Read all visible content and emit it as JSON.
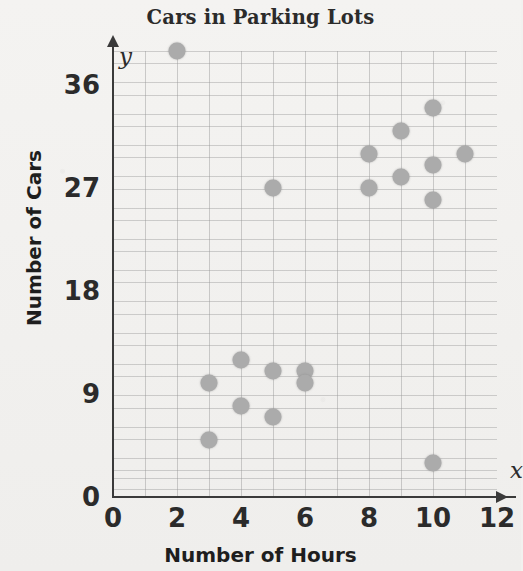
{
  "chart_data": {
    "type": "scatter",
    "title": "Cars in Parking Lots",
    "xlabel": "Number of Hours",
    "ylabel": "Number of Cars",
    "x_axis_symbol": "x",
    "y_axis_symbol": "y",
    "xlim": [
      0,
      12
    ],
    "ylim": [
      0,
      39
    ],
    "xticks": [
      "0",
      "2",
      "4",
      "6",
      "8",
      "10",
      "12"
    ],
    "xtick_values": [
      0,
      2,
      4,
      6,
      8,
      10,
      12
    ],
    "yticks": [
      "0",
      "9",
      "18",
      "27",
      "36"
    ],
    "ytick_values": [
      0,
      9,
      18,
      27,
      36
    ],
    "grid": true,
    "grid_x_step": 1,
    "grid_y_step": 3,
    "legend": "none",
    "point_color": "#ababab",
    "axis_color": "#3a3a3a",
    "background_color": "#f2f1ef",
    "points": [
      {
        "x": 2,
        "y": 39
      },
      {
        "x": 3,
        "y": 10
      },
      {
        "x": 3,
        "y": 5
      },
      {
        "x": 4,
        "y": 12
      },
      {
        "x": 4,
        "y": 8
      },
      {
        "x": 5,
        "y": 27
      },
      {
        "x": 5,
        "y": 11
      },
      {
        "x": 5,
        "y": 7
      },
      {
        "x": 6,
        "y": 11
      },
      {
        "x": 6,
        "y": 10
      },
      {
        "x": 8,
        "y": 30
      },
      {
        "x": 8,
        "y": 27
      },
      {
        "x": 9,
        "y": 32
      },
      {
        "x": 9,
        "y": 28
      },
      {
        "x": 10,
        "y": 34
      },
      {
        "x": 10,
        "y": 29
      },
      {
        "x": 10,
        "y": 26
      },
      {
        "x": 10,
        "y": 3
      },
      {
        "x": 11,
        "y": 30
      }
    ]
  }
}
